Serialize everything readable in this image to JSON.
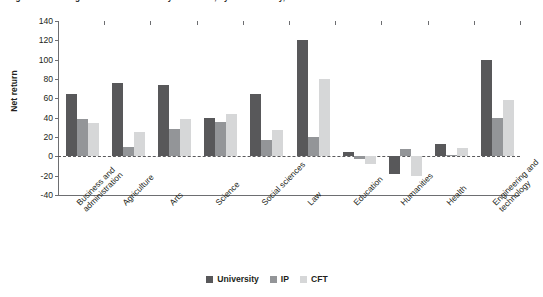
{
  "chart_data": {
    "type": "bar",
    "title": "Figure 3.4. Average net returns to tertiary education, by field of study, selected countries",
    "xlabel": "",
    "ylabel": "Net return",
    "ylim": [
      -40,
      140
    ],
    "yticks": [
      140,
      120,
      100,
      80,
      60,
      40,
      20,
      0,
      -20,
      -40
    ],
    "ytick_labels": [
      "140",
      "120",
      "100",
      "80",
      "60",
      "40",
      "20",
      "0",
      "-20",
      "-40"
    ],
    "grid": false,
    "zero_line": true,
    "legend_position": "bottom-center",
    "categories": [
      "Business and administration",
      "Agriculture",
      "Arts",
      "Science",
      "Social sciences",
      "Law",
      "Education",
      "Humanities",
      "Health",
      "Engineering and technology"
    ],
    "series": [
      {
        "name": "University",
        "color": "#58585a",
        "values": [
          64,
          76,
          74,
          40,
          65,
          120,
          4,
          -18,
          13,
          100
        ]
      },
      {
        "name": "IP",
        "color": "#939598",
        "values": [
          39,
          10,
          28,
          36,
          17,
          20,
          -3,
          8,
          1,
          40
        ]
      },
      {
        "name": "CFT",
        "color": "#d6d7d8",
        "values": [
          35,
          25,
          39,
          44,
          27,
          80,
          -8,
          -20,
          9,
          58
        ]
      }
    ]
  },
  "legend": {
    "items": [
      {
        "label": "University",
        "color": "#58585a"
      },
      {
        "label": "IP",
        "color": "#939598"
      },
      {
        "label": "CFT",
        "color": "#d6d7d8"
      }
    ]
  }
}
